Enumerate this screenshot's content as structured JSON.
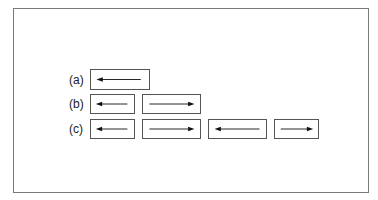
{
  "diagram": {
    "rows": [
      {
        "label": "(a)",
        "boxes": [
          {
            "direction": "left"
          }
        ]
      },
      {
        "label": "(b)",
        "boxes": [
          {
            "direction": "left"
          },
          {
            "direction": "right"
          }
        ]
      },
      {
        "label": "(c)",
        "boxes": [
          {
            "direction": "left"
          },
          {
            "direction": "right"
          },
          {
            "direction": "left"
          },
          {
            "direction": "right"
          }
        ]
      }
    ],
    "colors": {
      "frame": "#7a7a7a",
      "box_border": "#555555",
      "arrow": "#111111"
    }
  }
}
